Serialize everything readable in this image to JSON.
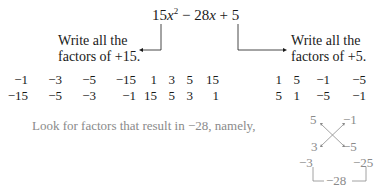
{
  "expression": {
    "coef_a": "15",
    "var": "x",
    "exp": "2",
    "middle": " − 28",
    "var2": "x",
    "tail": " + 5"
  },
  "left_label": {
    "line1": "Write all the",
    "line2": "factors of  +15."
  },
  "right_label": {
    "line1": "Write all the",
    "line2": "factors of  +5."
  },
  "factors_15": {
    "top": [
      "−1",
      "−3",
      "−5",
      "−15",
      "1",
      "3",
      "5",
      "15"
    ],
    "bottom": [
      "−15",
      "−5",
      "−3",
      "−1",
      "15",
      "5",
      "3",
      "1"
    ]
  },
  "factors_5": {
    "top": [
      "1",
      "5",
      "−1",
      "−5"
    ],
    "bottom": [
      "5",
      "1",
      "−5",
      "−1"
    ]
  },
  "instruction": "Look for factors that result in  −28, namely,",
  "cross_diagram": {
    "top_left": "5",
    "top_right": "−1",
    "bottom_left": "3",
    "bottom_right": "−5",
    "product_left": "−3",
    "product_right": "−25",
    "sum": "−28"
  },
  "colors": {
    "text": "#1a1a1a",
    "muted": "#8a8a8a"
  }
}
